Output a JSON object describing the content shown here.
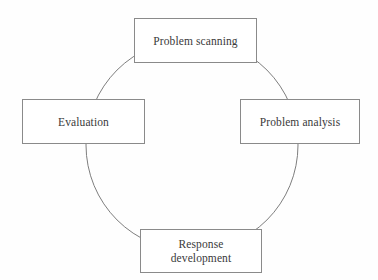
{
  "diagram": {
    "shape": "circle",
    "background_color": "#fefefe",
    "circle": {
      "center_x": 192,
      "center_y": 145,
      "radius": 106,
      "stroke_color": "#7d7d7d",
      "stroke_width": 1,
      "fill": "none"
    },
    "box_style": {
      "border_color": "#8a8a8a",
      "fill_color": "#ffffff",
      "text_color": "#3a3a3a"
    },
    "nodes": [
      {
        "id": "top",
        "label": "Problem scanning",
        "position": "top",
        "x": 134,
        "y": 18,
        "width": 123,
        "height": 45
      },
      {
        "id": "right",
        "label": "Problem analysis",
        "position": "right",
        "x": 240,
        "y": 99,
        "width": 120,
        "height": 45
      },
      {
        "id": "bottom",
        "label": "Response\ndevelopment",
        "position": "bottom",
        "x": 140,
        "y": 229,
        "width": 122,
        "height": 44
      },
      {
        "id": "left",
        "label": "Evaluation",
        "position": "left",
        "x": 22,
        "y": 99,
        "width": 123,
        "height": 45
      }
    ]
  }
}
